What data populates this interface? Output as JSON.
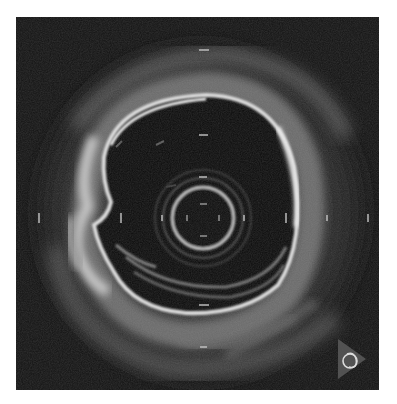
{
  "image": {
    "kind": "intravascular ultrasound cross-section",
    "background_color": "#121212",
    "page_background": "#ffffff",
    "frame": {
      "x": 16,
      "y": 17,
      "width": 363,
      "height": 373
    }
  },
  "catheter": {
    "cx": 187,
    "cy": 201,
    "r": 31,
    "color": "#bdbdbd"
  },
  "lumen_border_color": "#e6e6e6",
  "tick_marks": {
    "horizontal_axis_y": 201,
    "horizontal_x": [
      23,
      105,
      146,
      270,
      311,
      352
    ],
    "vertical_axis_x": 188,
    "vertical_y": [
      33,
      118,
      288,
      330
    ],
    "inner_catheter_ticks": [
      "top",
      "bottom",
      "left",
      "right"
    ]
  },
  "orientation_marker": {
    "icon": "orientation-triangle-icon",
    "glyph": "ring-loop",
    "x": 338,
    "y": 352
  }
}
